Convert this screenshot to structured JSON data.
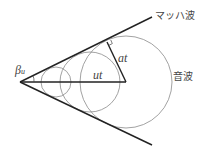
{
  "diagram": {
    "type": "mach-cone",
    "labels": {
      "mach_wave": "マッハ波",
      "sound_wave": "音波",
      "angle_symbol": "β",
      "angle_subscript": "u",
      "velocity_distance": "ut",
      "sound_distance": "at"
    },
    "geometry": {
      "apex": [
        20,
        82
      ],
      "upper_line_end": [
        152,
        17
      ],
      "lower_line_end": [
        152,
        145
      ],
      "axis_end": [
        126,
        82
      ],
      "circles": [
        {
          "cx": 56,
          "cy": 82,
          "r": 15
        },
        {
          "cx": 90,
          "cy": 82,
          "r": 30
        },
        {
          "cx": 126,
          "cy": 82,
          "r": 46
        }
      ],
      "tangent_point": [
        107,
        42
      ]
    },
    "colors": {
      "line": "#222222",
      "circle": "#888888",
      "text": "#444444"
    }
  }
}
